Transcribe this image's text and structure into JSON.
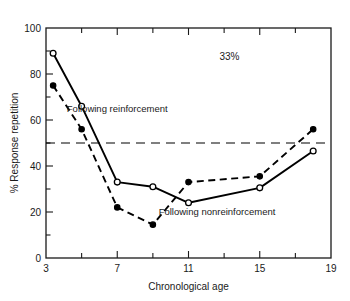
{
  "chart_data": {
    "type": "line",
    "title": "",
    "xlabel": "Chronological age",
    "ylabel": "% Response repetition",
    "xlim": [
      3,
      19
    ],
    "ylim": [
      0,
      100
    ],
    "grid": false,
    "legend_position": "inline-annotations",
    "x_ticks_major": [
      3,
      7,
      11,
      15,
      19
    ],
    "x_ticks_minor": [
      5,
      9,
      13,
      17
    ],
    "x_tick_labels": [
      "3",
      "7",
      "11",
      "15",
      "19"
    ],
    "y_ticks_major": [
      0,
      20,
      40,
      60,
      80,
      100
    ],
    "y_ticks_minor": [
      10,
      30,
      50,
      70,
      90
    ],
    "y_tick_labels": [
      "0",
      "20",
      "40",
      "60",
      "80",
      "100"
    ],
    "series": [
      {
        "name": "Following reinforcement",
        "marker": "open-circle",
        "line_style": "solid",
        "color": "#000000",
        "x": [
          3.4,
          5.0,
          7.0,
          9.0,
          11.0,
          15.0,
          18.0
        ],
        "values": [
          89,
          66,
          33,
          31,
          24,
          30.5,
          46.5
        ]
      },
      {
        "name": "Following nonreinforcement",
        "marker": "filled-circle",
        "line_style": "dashed",
        "color": "#000000",
        "x": [
          3.4,
          5.0,
          7.0,
          9.0,
          11.0,
          15.0,
          18.0
        ],
        "values": [
          75,
          56,
          22,
          14.5,
          33,
          35.5,
          56
        ]
      }
    ],
    "reference_lines": [
      {
        "name": "chance-level",
        "orientation": "horizontal",
        "value": 50,
        "style": "dashed",
        "color": "#000000"
      }
    ],
    "annotations": [
      {
        "name": "percent-annotation",
        "text": "33%",
        "x": 13.3,
        "y": 86
      },
      {
        "name": "series-label-reinforcement",
        "text": "Following reinforcement",
        "x": 7.0,
        "y": 63.5
      },
      {
        "name": "series-label-nonreinforcement",
        "text": "Following nonreinforcement",
        "x": 12.6,
        "y": 18.5
      }
    ]
  }
}
